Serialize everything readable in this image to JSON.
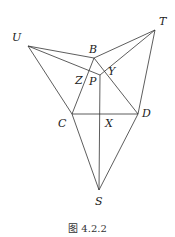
{
  "figure": {
    "caption": "图 4.2.2",
    "points": {
      "U": {
        "label": "U",
        "x": 28,
        "y": 46
      },
      "B": {
        "label": "B",
        "x": 94,
        "y": 58
      },
      "T": {
        "label": "T",
        "x": 155,
        "y": 30
      },
      "P": {
        "label": "P",
        "x": 100,
        "y": 75
      },
      "Z": {
        "label": "Z"
      },
      "Y": {
        "label": "Y"
      },
      "C": {
        "label": "C",
        "x": 72,
        "y": 114
      },
      "D": {
        "label": "D",
        "x": 138,
        "y": 114
      },
      "X": {
        "label": "X",
        "x": 100,
        "y": 114
      },
      "S": {
        "label": "S",
        "x": 99,
        "y": 190
      }
    },
    "segments": [
      [
        "U",
        "B"
      ],
      [
        "U",
        "P"
      ],
      [
        "U",
        "C"
      ],
      [
        "B",
        "T"
      ],
      [
        "T",
        "P"
      ],
      [
        "T",
        "D"
      ],
      [
        "B",
        "C"
      ],
      [
        "B",
        "D"
      ],
      [
        "C",
        "D"
      ],
      [
        "P",
        "S"
      ],
      [
        "C",
        "S"
      ],
      [
        "D",
        "S"
      ]
    ],
    "stroke_color": "#333333"
  }
}
